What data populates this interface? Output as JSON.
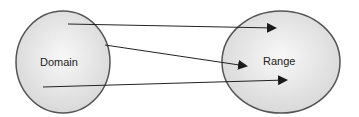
{
  "diagram": {
    "type": "mapping",
    "sets": [
      {
        "id": "domain",
        "label": "Domain",
        "cx": 63,
        "cy": 62,
        "rx": 47,
        "ry": 51,
        "label_x": 40,
        "label_y": 66
      },
      {
        "id": "range",
        "label": "Range",
        "cx": 281,
        "cy": 62,
        "rx": 59,
        "ry": 51,
        "label_x": 263,
        "label_y": 65
      }
    ],
    "arrows": [
      {
        "from": "domain",
        "to": "range",
        "x1": 68,
        "y1": 24,
        "x2": 275,
        "y2": 28
      },
      {
        "from": "domain",
        "to": "range",
        "x1": 105,
        "y1": 45,
        "x2": 246,
        "y2": 66
      },
      {
        "from": "domain",
        "to": "range",
        "x1": 43,
        "y1": 87,
        "x2": 286,
        "y2": 80
      }
    ],
    "colors": {
      "fill_center": "#f7f7f7",
      "fill_edge": "#d9d9d9",
      "stroke": "#555555",
      "arrow": "#222222"
    }
  }
}
